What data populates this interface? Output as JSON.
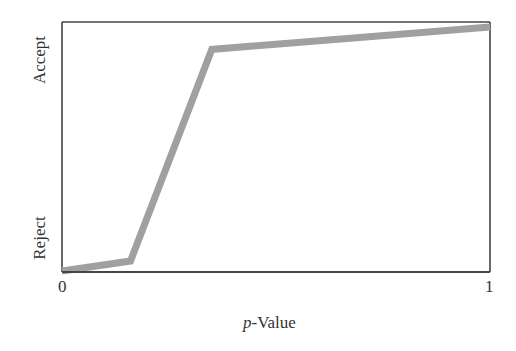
{
  "chart_data": {
    "type": "line",
    "title": "",
    "xlabel_italic": "p",
    "xlabel_rest": "-Value",
    "xlabel": "p-Value",
    "ylabel": "",
    "xlim": [
      0,
      1
    ],
    "ylim": [
      0,
      1
    ],
    "x_ticks": [
      "0",
      "1"
    ],
    "y_ticks": [
      "Reject",
      "Accept"
    ],
    "grid": false,
    "legend": null,
    "series": [
      {
        "name": "decision curve",
        "color": "#a0a0a0",
        "x": [
          0.0,
          0.16,
          0.35,
          1.0
        ],
        "y": [
          0.0,
          0.04,
          0.89,
          0.98
        ]
      }
    ]
  },
  "colors": {
    "axis": "#444444",
    "line": "#a0a0a0"
  }
}
